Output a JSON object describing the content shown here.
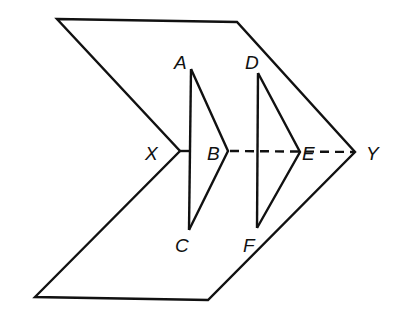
{
  "diagram": {
    "points": {
      "X": "X",
      "Y": "Y",
      "A": "A",
      "B": "B",
      "C": "C",
      "D": "D",
      "E": "E",
      "F": "F"
    },
    "segments": [
      {
        "name": "XY",
        "style": "solid-then-dashed"
      },
      {
        "name": "AB",
        "style": "solid"
      },
      {
        "name": "BC",
        "style": "solid"
      },
      {
        "name": "AC",
        "style": "solid"
      },
      {
        "name": "DE",
        "style": "solid"
      },
      {
        "name": "EF",
        "style": "solid"
      },
      {
        "name": "DF",
        "style": "solid"
      }
    ],
    "colors": {
      "stroke": "#111111",
      "background": "#ffffff"
    }
  }
}
